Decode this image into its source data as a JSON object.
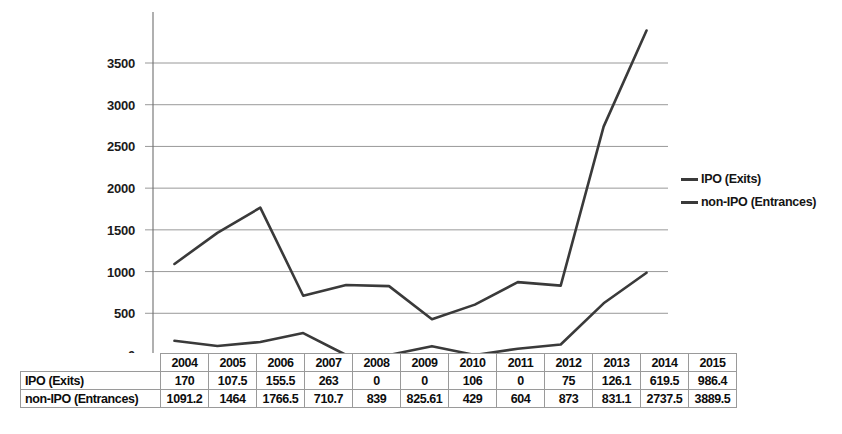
{
  "chart_data": {
    "type": "line",
    "title": "",
    "xlabel": "",
    "ylabel": "",
    "categories": [
      "2004",
      "2005",
      "2006",
      "2007",
      "2008",
      "2009",
      "2010",
      "2011",
      "2012",
      "2013",
      "2014",
      "2015"
    ],
    "ylim": [
      0,
      4000
    ],
    "yticks": [
      0,
      500,
      1000,
      1500,
      2000,
      2500,
      3000,
      3500
    ],
    "ytick_labels": [
      "0",
      "500",
      "1000",
      "1500",
      "2000",
      "2500",
      "3000",
      "3500"
    ],
    "grid": true,
    "legend_position": "right",
    "series": [
      {
        "name": "IPO (Exits)",
        "color": "#3a3a3a",
        "values": [
          170,
          107.5,
          155.5,
          263,
          0,
          0,
          106,
          0,
          75,
          126.1,
          619.5,
          986.4
        ],
        "labels": [
          "170",
          "107.5",
          "155.5",
          "263",
          "0",
          "0",
          "106",
          "0",
          "75",
          "126.1",
          "619.5",
          "986.4"
        ]
      },
      {
        "name": "non-IPO (Entrances)",
        "color": "#3a3a3a",
        "values": [
          1091.2,
          1464,
          1766.5,
          710.7,
          839,
          825.61,
          429,
          604,
          873,
          831.1,
          2737.5,
          3889.5
        ],
        "labels": [
          "1091.2",
          "1464",
          "1766.5",
          "710.7",
          "839",
          "825.61",
          "429",
          "604",
          "873",
          "831.1",
          "2737.5",
          "3889.5"
        ]
      }
    ]
  },
  "legend": {
    "items": [
      {
        "label": "IPO (Exits)"
      },
      {
        "label": "non-IPO (Entrances)"
      }
    ]
  },
  "table": {
    "corner_label": "",
    "header": [
      "2004",
      "2005",
      "2006",
      "2007",
      "2008",
      "2009",
      "2010",
      "2011",
      "2012",
      "2013",
      "2014",
      "2015"
    ],
    "rows": [
      {
        "label": "IPO (Exits)",
        "values": [
          "170",
          "107.5",
          "155.5",
          "263",
          "0",
          "0",
          "106",
          "0",
          "75",
          "126.1",
          "619.5",
          "986.4"
        ]
      },
      {
        "label": "non-IPO (Entrances)",
        "values": [
          "1091.2",
          "1464",
          "1766.5",
          "710.7",
          "839",
          "825.61",
          "429",
          "604",
          "873",
          "831.1",
          "2737.5",
          "3889.5"
        ]
      }
    ]
  },
  "colors": {
    "line": "#3a3a3a",
    "grid": "#8d8d8d",
    "axis": "#6f6f6f",
    "text": "#111111",
    "table_border": "#9a9a9a",
    "background": "#ffffff"
  }
}
